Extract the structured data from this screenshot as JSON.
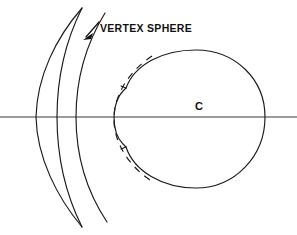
{
  "figure": {
    "background_color": "#ffffff",
    "ink_color": "#1a1a1a",
    "width": 297,
    "height": 235
  },
  "labels": {
    "vertex_sphere": "VERTEX SPHERE",
    "center": "C"
  },
  "annotations": {
    "leader_arrow_name": "leader-arrow-to-vertex-sphere",
    "optical_axis_name": "optical-axis"
  },
  "elements": {
    "lens_front_surface": "lens-front-surface-arc",
    "lens_back_surface": "lens-back-surface-arc",
    "vertex_sphere_arc": "vertex-sphere-arc",
    "eye_globe": "eye-globe-outline",
    "cornea": "cornea-outline",
    "dashed_vertex_sphere": "vertex-sphere-dashed-arc"
  }
}
